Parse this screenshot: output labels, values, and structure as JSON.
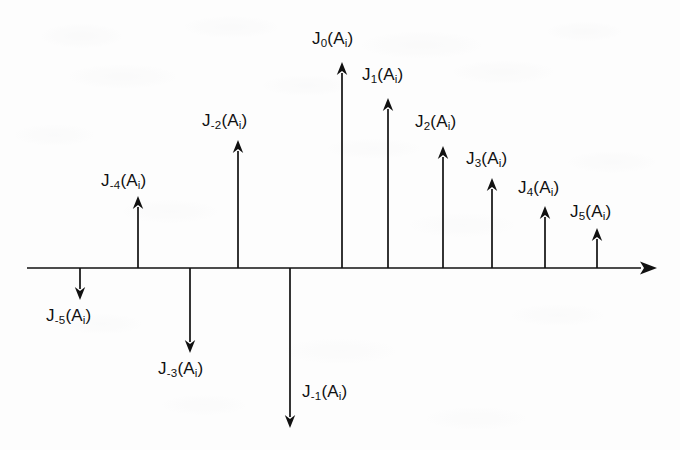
{
  "figure": {
    "background_color": "#fdfdfd",
    "ink_color": "#111111",
    "axis": {
      "name": "horizontal-axis",
      "x_start": 27,
      "x_end": 657,
      "y": 268,
      "has_right_arrowhead": true
    }
  },
  "chart_data": {
    "type": "bar",
    "title": "",
    "xlabel": "",
    "ylabel": "",
    "grid": false,
    "legend": "none",
    "orientation": "vertical-stem",
    "baseline": 0,
    "note": "Stem (impulse) plot of Bessel-function sideband amplitudes J_n(A_i); bar sign indicates arrow direction (up = positive, down = negative); magnitudes read as pixel stem lengths from the axis.",
    "categories": [
      "J-5",
      "J-4",
      "J-3",
      "J-2",
      "J-1",
      "J0",
      "J1",
      "J2",
      "J3",
      "J4",
      "J5"
    ],
    "labels": [
      "J₋₅(Aᵢ)",
      "J₋₄(Aᵢ)",
      "J₋₃(Aᵢ)",
      "J₋₂(Aᵢ)",
      "J₋₁(Aᵢ)",
      "J₀(Aᵢ)",
      "J₁(Aᵢ)",
      "J₂(Aᵢ)",
      "J₃(Aᵢ)",
      "J₄(Aᵢ)",
      "J₅(Aᵢ)"
    ],
    "values": [
      -32,
      72,
      -85,
      128,
      -160,
      206,
      170,
      122,
      90,
      62,
      40
    ],
    "directions": [
      "down",
      "up",
      "down",
      "up",
      "down",
      "up",
      "up",
      "up",
      "up",
      "up",
      "up"
    ]
  },
  "stems": [
    {
      "id": "stem-jm5",
      "base": "J",
      "index": "-5",
      "arg_open": "(A",
      "arg_sub": "i",
      "arg_close": ")",
      "direction": "down",
      "x": 80,
      "tip_y": 300,
      "label_x": 46,
      "label_y": 307
    },
    {
      "id": "stem-jm4",
      "base": "J",
      "index": "-4",
      "arg_open": "(A",
      "arg_sub": "i",
      "arg_close": ")",
      "direction": "up",
      "x": 138,
      "tip_y": 196,
      "label_x": 101,
      "label_y": 172
    },
    {
      "id": "stem-jm3",
      "base": "J",
      "index": "-3",
      "arg_open": "(A",
      "arg_sub": "i",
      "arg_close": ")",
      "direction": "down",
      "x": 190,
      "tip_y": 353,
      "label_x": 158,
      "label_y": 360
    },
    {
      "id": "stem-jm2",
      "base": "J",
      "index": "-2",
      "arg_open": "(A",
      "arg_sub": "i",
      "arg_close": ")",
      "direction": "up",
      "x": 238,
      "tip_y": 140,
      "label_x": 202,
      "label_y": 112
    },
    {
      "id": "stem-jm1",
      "base": "J",
      "index": "-1",
      "arg_open": "(A",
      "arg_sub": "i",
      "arg_close": ")",
      "direction": "down",
      "x": 290,
      "tip_y": 428,
      "label_x": 302,
      "label_y": 383
    },
    {
      "id": "stem-j0",
      "base": "J",
      "index": "0",
      "arg_open": "(A",
      "arg_sub": "i",
      "arg_close": ")",
      "direction": "up",
      "x": 342,
      "tip_y": 62,
      "label_x": 312,
      "label_y": 30
    },
    {
      "id": "stem-j1",
      "base": "J",
      "index": "1",
      "arg_open": "(A",
      "arg_sub": "i",
      "arg_close": ")",
      "direction": "up",
      "x": 388,
      "tip_y": 98,
      "label_x": 362,
      "label_y": 66
    },
    {
      "id": "stem-j2",
      "base": "J",
      "index": "2",
      "arg_open": "(A",
      "arg_sub": "i",
      "arg_close": ")",
      "direction": "up",
      "x": 443,
      "tip_y": 146,
      "label_x": 415,
      "label_y": 113
    },
    {
      "id": "stem-j3",
      "base": "J",
      "index": "3",
      "arg_open": "(A",
      "arg_sub": "i",
      "arg_close": ")",
      "direction": "up",
      "x": 492,
      "tip_y": 178,
      "label_x": 466,
      "label_y": 150
    },
    {
      "id": "stem-j4",
      "base": "J",
      "index": "4",
      "arg_open": "(A",
      "arg_sub": "i",
      "arg_close": ")",
      "direction": "up",
      "x": 545,
      "tip_y": 206,
      "label_x": 518,
      "label_y": 179
    },
    {
      "id": "stem-j5",
      "base": "J",
      "index": "5",
      "arg_open": "(A",
      "arg_sub": "i",
      "arg_close": ")",
      "direction": "up",
      "x": 597,
      "tip_y": 228,
      "label_x": 570,
      "label_y": 203
    }
  ]
}
